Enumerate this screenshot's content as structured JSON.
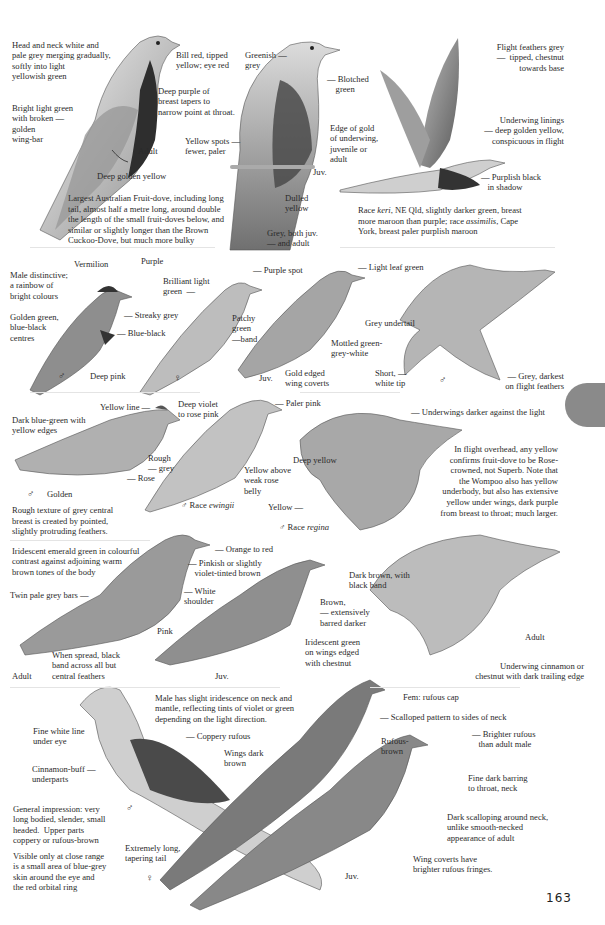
{
  "page": {
    "number": "163",
    "side_tab_color": "#8a8a8a"
  },
  "sections": [
    {
      "id": "wompoo",
      "labels": {
        "head_neck": "Head and neck white and\npale grey merging gradually,\nsoftly into light\nyellowish green",
        "bill": "Bill red, tipped\nyellow; eye red",
        "breast": "Deep purple of\nbreast tapers to\nnarrow point at throat.",
        "wingbar": "Bright light green\nwith broken —\ngolden\nwing-bar",
        "adult": "Adult",
        "vent": "Deep golden yellow",
        "juv_head": "Greenish —\ngrey",
        "juv_blotched": "— Blotched\n    green",
        "juv_spots": "Yellow spots —\nfewer, paler",
        "juv_edge": "Edge of gold\nof underwing,\njuvenile or\nadult",
        "juv": "Juv.",
        "juv_dulled": "Dulled\nyellow",
        "tail_grey": "Grey, both juv.\n— and adult",
        "flight_feathers": "Flight feathers grey\n—  tipped, chestnut\ntowards base",
        "underwing": "Underwing linings\n— deep golden yellow,\nconspicuous in flight",
        "shadow": "— Purplish black\n   in shadow"
      },
      "description": "Largest Australian Fruit-dove, including long tail, almost half a metre long, around double the length of the small fruit-doves below, and similar or slightly longer than the Brown Cuckoo-Dove, but much more bulky",
      "races_note_parts": [
        "Race ",
        "keri",
        ", NE Qld, slightly darker green, breast more maroon than purple; race ",
        "assimilis",
        ", Cape York, breast paler purplish maroon"
      ]
    },
    {
      "id": "superb",
      "labels": {
        "vermilion": "Vermilion",
        "purple": "Purple",
        "male_distinctive": "Male distinctive;\na rainbow of\nbright colours",
        "golden_green": "Golden green,\nblue-black\ncentres",
        "streaky": "— Streaky grey",
        "blue_black": "— Blue-black",
        "deep_pink": "Deep pink",
        "male_symbol": "♂",
        "brilliant": "Brilliant light\ngreen  —",
        "purple_spot": "— Purple spot",
        "patchy": "Patchy\ngreen\n—band",
        "female_symbol": "♀",
        "juv": "Juv.",
        "gold_edged": "Gold edged\nwing coverts",
        "leaf_green": "— Light leaf green",
        "mottled": "Mottled green-\ngrey-white",
        "grey_undertail": "Grey undertail",
        "short_tip": "Short, —\nwhite tip",
        "flight_male": "♂",
        "grey_darkest": "— Grey, darkest\non flight feathers"
      }
    },
    {
      "id": "rose_crowned",
      "labels": {
        "yellow_line": "Yellow line —",
        "deep_violet": "Deep violet\nto rose pink",
        "dark_blue_green": "Dark blue-green with\nyellow edges",
        "rough_grey": "Rough\n— grey",
        "rose": "— Rose",
        "golden": "Golden",
        "male_symbol": "♂",
        "paler_pink": "— Paler pink",
        "yellow_above": "Yellow above\nweak rose\nbelly",
        "race_ewingii_prefix": "♂ Race ",
        "race_ewingii": "ewingii",
        "underwings": "— Underwings darker against the light",
        "deep_yellow": "Deep yellow",
        "yellow": "Yellow —",
        "race_regina_prefix": "♂ Race ",
        "race_regina": "regina"
      },
      "texture_note": "Rough texture of grey central breast is created by pointed, slightly protruding feathers.",
      "flight_note": "In flight overhead, any yellow confirms fruit-dove to be Rose-crowned, not Superb. Note that the Wompoo also has yellow underbody, but also has extensive yellow under wings, dark purple from breast to throat; much larger."
    },
    {
      "id": "emerald",
      "labels": {
        "iridescent": "Iridescent emerald green in colourful\ncontrast against adjoining warm\nbrown tones of the body",
        "orange_red": "— Orange to red",
        "pinkish": "— Pinkish or slightly\n   violet-tinted brown",
        "twin_bars": "Twin pale grey bars —",
        "white_shoulder": "— White\nshoulder",
        "pink": "Pink",
        "spread": "When spread, black\nband across all but\ncentral feathers",
        "adult": "Adult",
        "juv": "Juv.",
        "dark_brown": "Dark brown, with\nblack band",
        "brown_barred": "Brown,\n— extensively\nbarred darker",
        "iridescent_green": "Iridescent green\non wings edged\nwith chestnut",
        "adult_flight": "Adult",
        "underwing": "Underwing cinnamon or\nchestnut with dark trailing edge"
      }
    },
    {
      "id": "brown_cuckoo_dove",
      "labels": {
        "male_iridescence": "Male has slight iridescence on neck and\nmantle, reflecting tints of violet or green\ndepending on the light direction.",
        "fine_white": "Fine white line\nunder eye",
        "coppery": "— Coppery rufous",
        "wings_dark": "Wings dark\nbrown",
        "cinnamon": "Cinnamon-buff —\nunderparts",
        "male_symbol": "♂",
        "general": "General impression: very\nlong bodied, slender, small\nheaded.  Upper parts\ncoppery or rufous-brown",
        "visible": "Visible only at close range\nis a small area of blue-grey\nskin around the eye and\nthe red orbital ring",
        "long_tail": "Extremely long,\ntapering tail",
        "female_symbol": "♀",
        "fem_cap": "Fem: rufous cap",
        "scalloped": "— Scalloped pattern to sides of neck",
        "rufous_brown": "Rufous-\nbrown",
        "brighter": "— Brighter rufous\n   than adult male",
        "fine_dark": "Fine dark barring\nto throat, neck",
        "dark_scalloping": "Dark scalloping around neck,\nunlike smooth-necked\nappearance of adult",
        "juv": "Juv.",
        "wing_coverts": "Wing coverts have\nbrighter rufous fringes."
      }
    }
  ]
}
